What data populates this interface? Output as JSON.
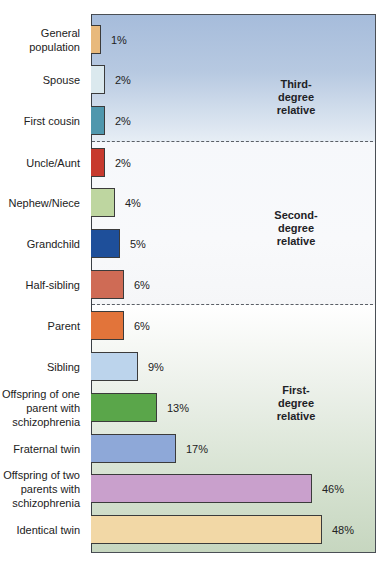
{
  "chart_data": {
    "type": "bar",
    "orientation": "horizontal",
    "title": "",
    "xlabel": "",
    "ylabel": "",
    "unit": "%",
    "grid": false,
    "categories": [
      "General population",
      "Spouse",
      "First cousin",
      "Uncle/Aunt",
      "Nephew/Niece",
      "Grandchild",
      "Half-sibling",
      "Parent",
      "Sibling",
      "Offspring of one parent with schizophrenia",
      "Fraternal twin",
      "Offspring of two parents with schizophrenia",
      "Identical twin"
    ],
    "values": [
      1,
      2,
      2,
      2,
      4,
      5,
      6,
      6,
      9,
      13,
      17,
      46,
      48
    ],
    "groups": [
      {
        "name": "Third-degree relative",
        "categories": [
          "General population",
          "Spouse",
          "First cousin"
        ]
      },
      {
        "name": "Second-degree relative",
        "categories": [
          "Uncle/Aunt",
          "Nephew/Niece",
          "Grandchild",
          "Half-sibling"
        ]
      },
      {
        "name": "First-degree relative",
        "categories": [
          "Parent",
          "Sibling",
          "Offspring of one parent with schizophrenia",
          "Fraternal twin",
          "Offspring of two parents with schizophrenia",
          "Identical twin"
        ]
      }
    ],
    "xlim": [
      0,
      50
    ]
  },
  "zones": {
    "third": {
      "lines": [
        "Third-",
        "degree",
        "relative"
      ]
    },
    "second": {
      "lines": [
        "Second-",
        "degree",
        "relative"
      ]
    },
    "first": {
      "lines": [
        "First-",
        "degree",
        "relative"
      ]
    }
  },
  "rows": [
    {
      "label_lines": [
        "General",
        "population"
      ],
      "value": 1,
      "value_label": "1%",
      "color": "#e8b97c"
    },
    {
      "label_lines": [
        "Spouse"
      ],
      "value": 2,
      "value_label": "2%",
      "color": "#dbe9ee"
    },
    {
      "label_lines": [
        "First cousin"
      ],
      "value": 2,
      "value_label": "2%",
      "color": "#4f97ad"
    },
    {
      "label_lines": [
        "Uncle/Aunt"
      ],
      "value": 2,
      "value_label": "2%",
      "color": "#c73a2e"
    },
    {
      "label_lines": [
        "Nephew/Niece"
      ],
      "value": 4,
      "value_label": "4%",
      "color": "#bed6a0"
    },
    {
      "label_lines": [
        "Grandchild"
      ],
      "value": 5,
      "value_label": "5%",
      "color": "#1e4f9a"
    },
    {
      "label_lines": [
        "Half-sibling"
      ],
      "value": 6,
      "value_label": "6%",
      "color": "#cf6b55"
    },
    {
      "label_lines": [
        "Parent"
      ],
      "value": 6,
      "value_label": "6%",
      "color": "#e2743a"
    },
    {
      "label_lines": [
        "Sibling"
      ],
      "value": 9,
      "value_label": "9%",
      "color": "#bcd4ec"
    },
    {
      "label_lines": [
        "Offspring of one",
        "parent with",
        "schizophrenia"
      ],
      "value": 13,
      "value_label": "13%",
      "color": "#5aa64a"
    },
    {
      "label_lines": [
        "Fraternal twin"
      ],
      "value": 17,
      "value_label": "17%",
      "color": "#8ea8d8"
    },
    {
      "label_lines": [
        "Offspring of two",
        "parents with",
        "schizophrenia"
      ],
      "value": 46,
      "value_label": "46%",
      "color": "#c9a0cc"
    },
    {
      "label_lines": [
        "Identical twin"
      ],
      "value": 48,
      "value_label": "48%",
      "color": "#f2d8a6"
    }
  ]
}
